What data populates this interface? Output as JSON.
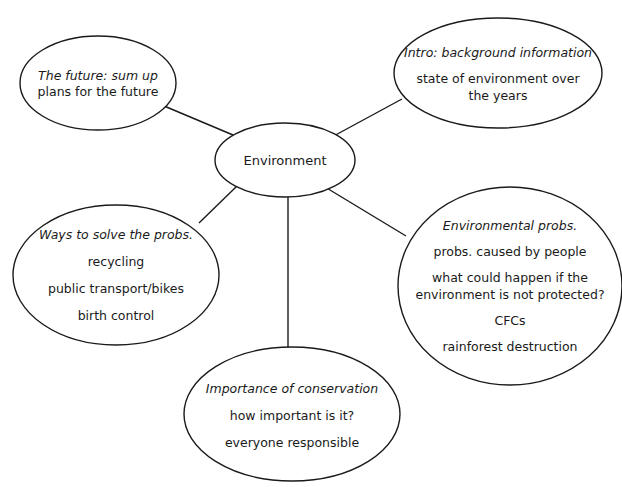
{
  "diagram": {
    "type": "mind-map",
    "center": {
      "label": "Environment"
    },
    "branches": [
      {
        "id": "future",
        "heading": "The future: sum up",
        "items": [
          "plans for the future"
        ]
      },
      {
        "id": "intro",
        "heading": "Intro: background information",
        "items": [
          "state of environment over",
          "the years"
        ]
      },
      {
        "id": "ways",
        "heading": "Ways to solve the probs.",
        "items": [
          "recycling",
          "public transport/bikes",
          "birth control"
        ]
      },
      {
        "id": "problems",
        "heading": "Environmental probs.",
        "items": [
          "probs. caused by people",
          "what could happen if the",
          "environment is not protected?",
          "CFCs",
          "rainforest destruction"
        ]
      },
      {
        "id": "importance",
        "heading": "Importance of conservation",
        "items": [
          "how important is it?",
          "everyone responsible"
        ]
      }
    ],
    "style": {
      "stroke_color": "#1a1a1a",
      "background": "#ffffff"
    }
  }
}
